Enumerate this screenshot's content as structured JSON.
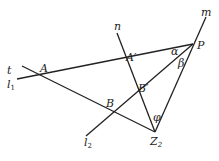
{
  "diagram": {
    "type": "geometry",
    "points": {
      "A": {
        "label": "A",
        "x": 44,
        "y": 76
      },
      "A_prime": {
        "label": "A′",
        "x": 128,
        "y": 64
      },
      "B": {
        "label": "B",
        "x": 111,
        "y": 110
      },
      "B_prime": {
        "label": "B′",
        "x": 139,
        "y": 94
      },
      "P": {
        "label": "P",
        "x": 193,
        "y": 44
      },
      "Z2": {
        "label": "Z",
        "sub": "2",
        "x": 155,
        "y": 132
      }
    },
    "lines": {
      "t": {
        "label": "t"
      },
      "l1": {
        "label": "l",
        "sub": "1"
      },
      "l2": {
        "label": "l",
        "sub": "2"
      },
      "m": {
        "label": "m"
      },
      "n": {
        "label": "n"
      }
    },
    "angles": {
      "alpha": {
        "label": "α"
      },
      "beta": {
        "label": "β"
      },
      "phi": {
        "label": "φ"
      }
    },
    "color": "#222222"
  }
}
